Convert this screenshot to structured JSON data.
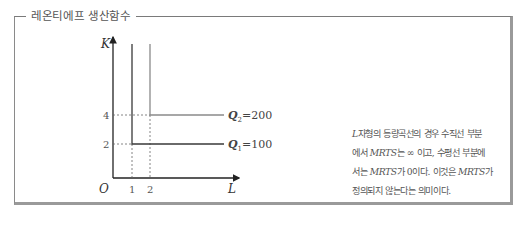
{
  "box": {
    "title": "레온티에프 생산함수"
  },
  "graph": {
    "y_axis_label": "K",
    "x_axis_label": "L",
    "origin_label": "O",
    "y_ticks": [
      "4",
      "2"
    ],
    "x_ticks": [
      "1",
      "2"
    ],
    "isoquants": [
      {
        "name": "Q",
        "sub": "1",
        "value": "=100",
        "corner_L": 1,
        "corner_K": 2,
        "color": "#3a3a3a"
      },
      {
        "name": "Q",
        "sub": "2",
        "value": "=200",
        "corner_L": 2,
        "corner_K": 4,
        "color": "#8a8a8a"
      }
    ]
  },
  "description": {
    "line1_a": "L",
    "line1_b": "자형의 등량곡선의 경우 수직선 부분",
    "line2_a": "에서 ",
    "line2_b": "MRTS",
    "line2_c": "는 ∞ 이고, 수평선 부분에",
    "line3_a": "서는 ",
    "line3_b": "MRTS",
    "line3_c": "가 0이다. 이것은 ",
    "line3_d": "MRTS",
    "line3_e": "가",
    "line4": "정의되지 않는다는 의미이다."
  }
}
